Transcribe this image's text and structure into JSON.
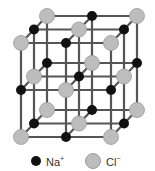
{
  "diagram": {
    "type": "crystal-lattice",
    "grid_size": 3,
    "colors": {
      "na": "#111111",
      "cl": "#bdbdbd",
      "bond": "#555555"
    }
  },
  "legend": {
    "na": {
      "label": "Na",
      "charge": "+"
    },
    "cl": {
      "label": "Cl",
      "charge": "−"
    }
  }
}
